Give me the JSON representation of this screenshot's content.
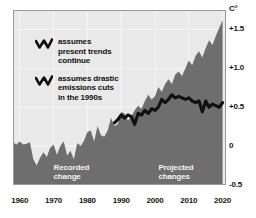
{
  "chart_data": {
    "type": "area",
    "title": "",
    "xlabel": "",
    "ylabel": "C°",
    "unit_label": "C°",
    "xlim": [
      1958,
      2021
    ],
    "ylim": [
      -0.5,
      1.75
    ],
    "xticks": [
      1960,
      1970,
      1980,
      1990,
      2000,
      2010,
      2020
    ],
    "xtick_labels": [
      "1960",
      "1970",
      "1980",
      "1990",
      "2000",
      "2010",
      "2020"
    ],
    "yticks": [
      -0.5,
      0,
      0.5,
      1.0,
      1.5
    ],
    "ytick_labels": [
      "-0.5",
      "0",
      "+0.5",
      "+1.0",
      "+1.5"
    ],
    "grid": true,
    "legend_position": "top-left",
    "annotations": [
      {
        "text": "Recorded\nchange",
        "x": 1970,
        "y": -0.28
      },
      {
        "text": "Projected\nchanges",
        "x": 2001,
        "y": -0.28
      }
    ],
    "series": [
      {
        "name": "assumes present trends continue",
        "style": "area",
        "fill_color": "#6e6e6e",
        "x": [
          1958,
          1959,
          1960,
          1961,
          1962,
          1963,
          1964,
          1965,
          1966,
          1967,
          1968,
          1969,
          1970,
          1971,
          1972,
          1973,
          1974,
          1975,
          1976,
          1977,
          1978,
          1979,
          1980,
          1981,
          1982,
          1983,
          1984,
          1985,
          1986,
          1987,
          1988,
          1989,
          1990,
          1991,
          1992,
          1993,
          1994,
          1995,
          1996,
          1997,
          1998,
          1999,
          2000,
          2001,
          2002,
          2003,
          2004,
          2005,
          2006,
          2007,
          2008,
          2009,
          2010,
          2011,
          2012,
          2013,
          2014,
          2015,
          2016,
          2017,
          2018,
          2019,
          2020
        ],
        "values": [
          0.05,
          0.02,
          0.06,
          0.02,
          0.03,
          0.05,
          -0.17,
          -0.25,
          -0.15,
          -0.08,
          -0.14,
          -0.02,
          0.02,
          -0.11,
          0.0,
          0.06,
          -0.12,
          -0.06,
          -0.17,
          0.04,
          0.0,
          0.07,
          0.18,
          0.2,
          0.06,
          0.26,
          0.14,
          0.12,
          0.2,
          0.36,
          0.26,
          0.28,
          0.44,
          0.42,
          0.33,
          0.38,
          0.46,
          0.52,
          0.48,
          0.58,
          0.66,
          0.6,
          0.64,
          0.76,
          0.7,
          0.8,
          0.86,
          0.8,
          0.92,
          0.96,
          0.9,
          1.0,
          1.1,
          1.04,
          1.16,
          1.22,
          1.14,
          1.26,
          1.36,
          1.3,
          1.42,
          1.52,
          1.62
        ]
      },
      {
        "name": "assumes drastic emissions cuts in the 1990s",
        "style": "line",
        "line_color": "#101010",
        "x": [
          1988,
          1989,
          1990,
          1991,
          1992,
          1993,
          1994,
          1995,
          1996,
          1997,
          1998,
          1999,
          2000,
          2001,
          2002,
          2003,
          2004,
          2005,
          2006,
          2007,
          2008,
          2009,
          2010,
          2011,
          2012,
          2013,
          2014,
          2015,
          2016,
          2017,
          2018,
          2019,
          2020
        ],
        "values": [
          0.3,
          0.34,
          0.4,
          0.36,
          0.4,
          0.38,
          0.28,
          0.42,
          0.4,
          0.46,
          0.42,
          0.48,
          0.46,
          0.5,
          0.6,
          0.56,
          0.6,
          0.66,
          0.62,
          0.64,
          0.62,
          0.6,
          0.62,
          0.58,
          0.56,
          0.58,
          0.44,
          0.58,
          0.5,
          0.54,
          0.52,
          0.5,
          0.56
        ]
      }
    ]
  },
  "legend": {
    "items": [
      {
        "icon": "zigzag-line-icon",
        "label": "assumes\npresent trends\ncontinue"
      },
      {
        "icon": "zigzag-line-icon",
        "label": "assumes drastic\nemissions cuts\nin the 1990s"
      }
    ]
  },
  "colors": {
    "plot_background": "#e9e9e9",
    "area_fill": "#6e6e6e",
    "line": "#101010",
    "gridline": "#f4f4f4",
    "axis_text": "#161616",
    "annotation_text": "#f2f2f2",
    "page_background": "#ffffff"
  }
}
